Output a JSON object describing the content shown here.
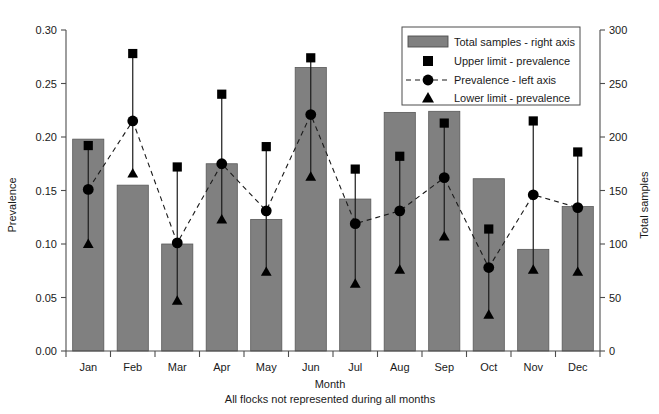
{
  "chart_data": {
    "type": "bar",
    "title": "",
    "subtitle": "",
    "xlabel": "Month",
    "caption": "All flocks not represented during all months",
    "ylabel_left": "Prevalence",
    "ylabel_right": "Total samples",
    "categories": [
      "Jan",
      "Feb",
      "Mar",
      "Apr",
      "May",
      "Jun",
      "Jul",
      "Aug",
      "Sep",
      "Oct",
      "Nov",
      "Dec"
    ],
    "ylim_left": [
      0.0,
      0.3
    ],
    "ylim_right": [
      0,
      300
    ],
    "yticks_left": [
      "0.00",
      "0.05",
      "0.10",
      "0.15",
      "0.20",
      "0.25",
      "0.30"
    ],
    "yticks_left_values": [
      0.0,
      0.05,
      0.1,
      0.15,
      0.2,
      0.25,
      0.3
    ],
    "yticks_right": [
      "0",
      "50",
      "100",
      "150",
      "200",
      "250",
      "300"
    ],
    "yticks_right_values": [
      0,
      50,
      100,
      150,
      200,
      250,
      300
    ],
    "grid": false,
    "legend_position": "top-right",
    "series": [
      {
        "name": "Total samples - right axis",
        "type": "bar",
        "axis": "right",
        "values": [
          198,
          155,
          100,
          175,
          123,
          265,
          142,
          223,
          224,
          161,
          95,
          135
        ]
      },
      {
        "name": "Upper limit - prevalence",
        "type": "marker",
        "marker": "square",
        "axis": "left",
        "values": [
          0.192,
          0.278,
          0.172,
          0.24,
          0.191,
          0.274,
          0.17,
          0.182,
          0.213,
          0.114,
          0.215,
          0.186
        ]
      },
      {
        "name": "Prevalence - left axis",
        "type": "line-marker",
        "marker": "circle",
        "axis": "left",
        "values": [
          0.151,
          0.215,
          0.101,
          0.175,
          0.131,
          0.221,
          0.119,
          0.131,
          0.162,
          0.078,
          0.146,
          0.134
        ]
      },
      {
        "name": "Lower limit - prevalence",
        "type": "marker",
        "marker": "triangle",
        "axis": "left",
        "values": [
          0.1,
          0.166,
          0.047,
          0.123,
          0.074,
          0.163,
          0.063,
          0.076,
          0.107,
          0.034,
          0.076,
          0.074
        ]
      }
    ]
  },
  "legend": {
    "items": [
      {
        "label": "Total samples - right axis",
        "marker": "bar-swatch"
      },
      {
        "label": "Upper limit - prevalence",
        "marker": "square"
      },
      {
        "label": "Prevalence - left axis",
        "marker": "dashed-circle"
      },
      {
        "label": "Lower limit - prevalence",
        "marker": "triangle"
      }
    ]
  },
  "colors": {
    "bar_fill": "#808080",
    "bar_stroke": "#595959",
    "marker": "#000000",
    "axis": "#4d4d4d",
    "text": "#1a1a1a",
    "background": "#ffffff"
  }
}
